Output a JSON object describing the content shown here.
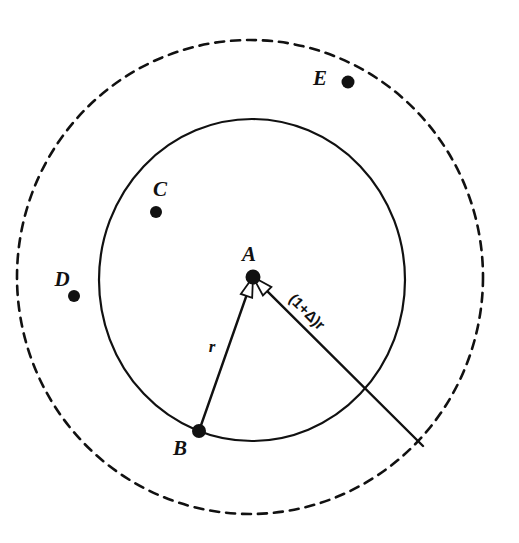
{
  "figure": {
    "canvas": {
      "width": 519,
      "height": 543,
      "background": "#ffffff"
    },
    "stroke_color": "#111111",
    "shapes": {
      "outer_circle": {
        "name": "outer-dashed-circle",
        "style": "dashed",
        "cx": 250,
        "cy": 277,
        "rx": 233,
        "ry": 237,
        "stroke_width": 2.6,
        "dash_pattern": "9 7"
      },
      "inner_circle": {
        "name": "inner-solid-circle",
        "style": "solid",
        "cx": 252,
        "cy": 280,
        "rx": 153,
        "ry": 161,
        "stroke_width": 2.2
      }
    },
    "points": [
      {
        "id": "A",
        "label": "A",
        "x": 253,
        "y": 277,
        "r": 7.5,
        "label_x": 249,
        "label_y": 261
      },
      {
        "id": "B",
        "label": "B",
        "x": 199,
        "y": 431,
        "r": 7.0,
        "label_x": 180,
        "label_y": 455
      },
      {
        "id": "C",
        "label": "C",
        "x": 156,
        "y": 212,
        "r": 6.0,
        "label_x": 160,
        "label_y": 196
      },
      {
        "id": "D",
        "label": "D",
        "x": 74,
        "y": 296,
        "r": 6.0,
        "label_x": 62,
        "label_y": 286
      },
      {
        "id": "E",
        "label": "E",
        "x": 348,
        "y": 82,
        "r": 6.5,
        "label_x": 320,
        "label_y": 85
      }
    ],
    "segments": [
      {
        "id": "radius-r",
        "name": "radius-segment-AB",
        "from": "A",
        "to": "B",
        "x1": 253,
        "y1": 277,
        "x2": 199,
        "y2": 431,
        "stroke_width": 2.4,
        "label": "r",
        "label_x": 212,
        "label_y": 352,
        "label_rotation": 0
      },
      {
        "id": "radius-delta",
        "name": "extended-radius-segment",
        "from": "A",
        "to": "outer-boundary",
        "x1": 253,
        "y1": 277,
        "x2": 423,
        "y2": 446,
        "stroke_width": 2.4,
        "label": "(1+Δ)r",
        "label_x": 288,
        "label_y": 300,
        "label_rotation": 45
      }
    ],
    "arrowheads": [
      {
        "name": "arrowhead-toward-B",
        "at_x": 253,
        "at_y": 277,
        "angle_deg": 109
      },
      {
        "name": "arrowhead-toward-outer",
        "at_x": 253,
        "at_y": 277,
        "angle_deg": 45
      }
    ]
  }
}
